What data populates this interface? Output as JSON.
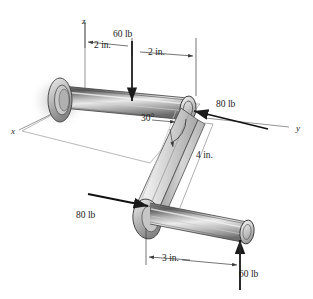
{
  "figure": {
    "type": "engineering-mechanics-free-body-diagram",
    "background_color": "#ffffff",
    "line_color": "#1a1a1a",
    "metal_light": "#e8e8e8",
    "metal_mid": "#b4b4b4",
    "metal_dark": "#555555"
  },
  "axes": [
    {
      "id": "z",
      "label": "z",
      "x": 82,
      "y": 17
    },
    {
      "id": "y",
      "label": "y",
      "x": 296,
      "y": 124
    },
    {
      "id": "x",
      "label": "x",
      "x": 11,
      "y": 127
    }
  ],
  "forces": [
    {
      "id": "force-60lb-top",
      "label": "60 lb",
      "value": 60,
      "unit": "lb",
      "direction": "down",
      "x": 113,
      "y": 30
    },
    {
      "id": "force-80lb-right",
      "label": "80 lb",
      "value": 80,
      "unit": "lb",
      "direction": "left",
      "x": 216,
      "y": 100
    },
    {
      "id": "force-80lb-left",
      "label": "80 lb",
      "value": 80,
      "unit": "lb",
      "direction": "right",
      "x": 76,
      "y": 211
    },
    {
      "id": "force-60lb-bottom",
      "label": "60 lb",
      "value": 60,
      "unit": "lb",
      "direction": "up",
      "x": 239,
      "y": 270
    }
  ],
  "dimensions": [
    {
      "id": "dim-2in-left",
      "label": "2 in.",
      "value": 2,
      "unit": "in.",
      "x": 94,
      "y": 45
    },
    {
      "id": "dim-2in-right",
      "label": "2 in.",
      "value": 2,
      "unit": "in.",
      "x": 148,
      "y": 53
    },
    {
      "id": "dim-4in",
      "label": "4 in.",
      "value": 4,
      "unit": "in.",
      "x": 196,
      "y": 155
    },
    {
      "id": "dim-3in",
      "label": "3 in.",
      "value": 3,
      "unit": "in.",
      "x": 162,
      "y": 260
    }
  ],
  "angles": [
    {
      "id": "angle-30deg",
      "label": "30°",
      "value": 30,
      "unit": "deg",
      "x": 141,
      "y": 114
    }
  ]
}
